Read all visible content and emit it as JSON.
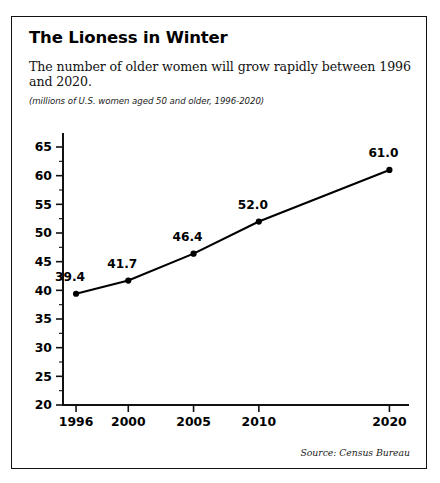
{
  "card": {
    "title": "The Lioness in Winter",
    "subtitle": "The number of older women will grow rapidly between 1996 and 2020.",
    "units_note": "(millions of U.S. women aged 50 and older, 1996-2020)",
    "source_note": "Source: Census Bureau",
    "border_color": "#111111",
    "background_color": "#ffffff"
  },
  "chart_data": {
    "type": "line",
    "title": "The Lioness in Winter",
    "subtitle": "The number of older women will grow rapidly between 1996 and 2020.",
    "units": "(millions of U.S. women aged 50 and older, 1996-2020)",
    "source": "Source: Census Bureau",
    "xlabel": "",
    "ylabel": "",
    "x": [
      1996,
      2000,
      2005,
      2010,
      2020
    ],
    "categories": [
      "1996",
      "2000",
      "2005",
      "2010",
      "2020"
    ],
    "values": [
      39.4,
      41.7,
      46.4,
      52.0,
      61.0
    ],
    "point_labels": [
      "39.4",
      "41.7",
      "46.4",
      "52.0",
      "61.0"
    ],
    "ylim": [
      20,
      65
    ],
    "xlim": [
      1995,
      2021.5
    ],
    "yticks": [
      20,
      25,
      30,
      35,
      40,
      45,
      50,
      55,
      60,
      65
    ],
    "ytick_labels": [
      "20",
      "25",
      "30",
      "35",
      "40",
      "45",
      "50",
      "55",
      "60",
      "65"
    ],
    "yminor_ticks": [
      22.5,
      27.5,
      32.5,
      37.5,
      42.5,
      47.5,
      52.5,
      57.5,
      62.5
    ],
    "xticks": [
      1996,
      2000,
      2005,
      2010,
      2020
    ],
    "xtick_labels": [
      "1996",
      "2000",
      "2005",
      "2010",
      "2020"
    ],
    "grid": false,
    "legend": false,
    "marker": "circle",
    "line_color": "#000000",
    "marker_color": "#000000"
  }
}
